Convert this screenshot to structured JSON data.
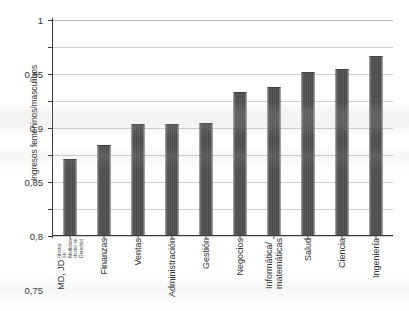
{
  "chart_data": {
    "type": "bar",
    "title": "",
    "subtitle": "",
    "xlabel": "",
    "ylabel": "Ingresos femeninos/masculinos",
    "ylim": [
      0.6,
      1
    ],
    "ytick_step": 0.05,
    "grid": true,
    "legend": null,
    "bar_color": "#4f4f4f",
    "gridline_color": "#cfcfcf",
    "axis_color": "#3a3a3a",
    "background_color": "#ffffff",
    "categories": [
      "MD, JD",
      "Finanzas",
      "Ventas",
      "Administración",
      "Gestión",
      "Negocios",
      "Informática/\nmatemáticas",
      "Salud",
      "Ciencia",
      "Ingeniería"
    ],
    "category_subtitles": [
      "(doctor en Medicina,\ndoctor en Derecho)",
      "",
      "",
      "",
      "",
      "",
      "",
      "",
      "",
      ""
    ],
    "values": [
      0.74,
      0.767,
      0.805,
      0.806,
      0.808,
      0.865,
      0.875,
      0.901,
      0.907,
      0.932
    ],
    "ytick_labels": [
      "1",
      "0,95",
      "0,9",
      "0,85",
      "0,8",
      "0,75",
      "0,7",
      "0,65",
      "0,6"
    ],
    "ytick_values": [
      1,
      0.95,
      0.9,
      0.85,
      0.8,
      0.75,
      0.7,
      0.65,
      0.6
    ]
  }
}
